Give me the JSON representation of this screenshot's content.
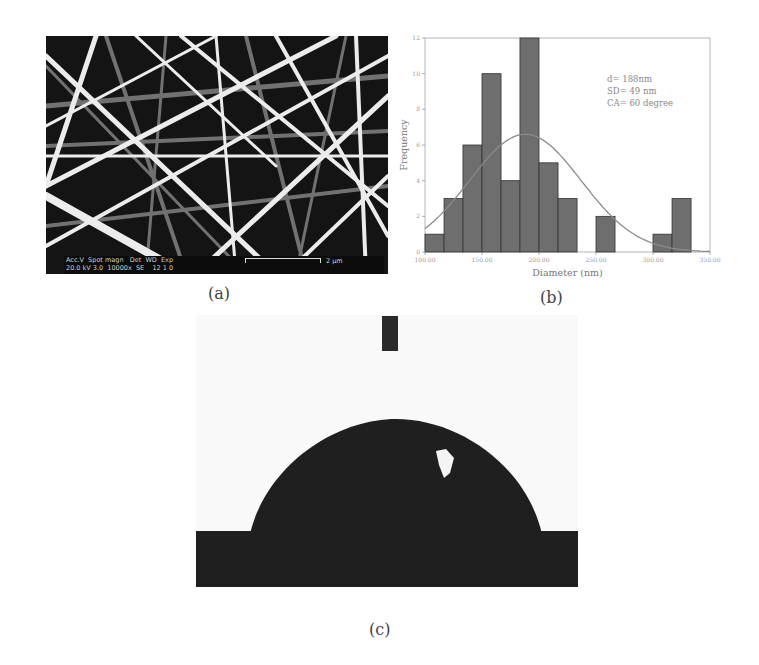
{
  "panels": {
    "a": {
      "label": "(a)",
      "sem_info": {
        "row1": "Acc.V  Spot magn   Det  WD  Exp",
        "row2": "20.0 kV 3.0  10000x  SE    12 1 0",
        "scale_bar": "2 µm"
      }
    },
    "b": {
      "label": "(b)"
    },
    "c": {
      "label": "(c)"
    }
  },
  "chart_data": {
    "type": "bar",
    "title": "",
    "xlabel": "Diameter (nm)",
    "ylabel": "Frequency",
    "xlim": [
      100,
      350
    ],
    "ylim": [
      0,
      12
    ],
    "x_ticks": [
      "100.00",
      "150.00",
      "200.00",
      "250.00",
      "300.00",
      "350.00"
    ],
    "y_ticks": [
      "0",
      "2",
      "4",
      "6",
      "8",
      "10",
      "12"
    ],
    "bin_width": 16.7,
    "bin_starts": [
      100,
      116.7,
      133.3,
      150,
      166.7,
      183.3,
      200,
      216.7,
      233.3,
      250,
      266.7,
      283.3,
      300,
      316.7
    ],
    "values": [
      1,
      3,
      6,
      10,
      4,
      12,
      5,
      3,
      0,
      2,
      0,
      0,
      1,
      3
    ],
    "fit_curve": {
      "type": "normal",
      "mean": 188,
      "sd": 49,
      "peak": 6.6
    },
    "annotations": [
      "d= 188nm",
      "SD= 49 nm",
      "CA= 60 degree"
    ],
    "grid": false,
    "legend": null,
    "colors": {
      "bar": "#6e6e6e",
      "bar_edge": "#333333",
      "curve": "#8a8a8a"
    }
  }
}
